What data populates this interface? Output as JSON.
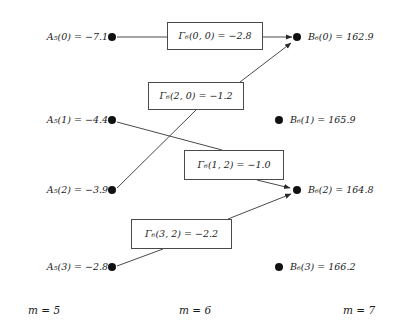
{
  "figure": {
    "type": "trellis-diagram"
  },
  "left_nodes": [
    {
      "id": "A5-0",
      "label_prefix": "A",
      "label_sub": "5",
      "label_text": "A₅(0) = −7.1",
      "index": 0,
      "value": -7.1,
      "x": 112,
      "y": 37
    },
    {
      "id": "A5-1",
      "label_prefix": "A",
      "label_sub": "5",
      "label_text": "A₅(1) = −4.4",
      "index": 1,
      "value": -4.4,
      "x": 112,
      "y": 120
    },
    {
      "id": "A5-2",
      "label_prefix": "A",
      "label_sub": "5",
      "label_text": "A₅(2) = −3.9",
      "index": 2,
      "value": -3.9,
      "x": 112,
      "y": 190
    },
    {
      "id": "A5-3",
      "label_prefix": "A",
      "label_sub": "5",
      "label_text": "A₅(3) = −2.8",
      "index": 3,
      "value": -2.8,
      "x": 112,
      "y": 267
    }
  ],
  "right_nodes": [
    {
      "id": "B6-0",
      "label_prefix": "B",
      "label_sub": "6",
      "label_text": "B₆(0) = 162.9",
      "index": 0,
      "value": 162.9,
      "x": 297,
      "y": 37
    },
    {
      "id": "B6-1",
      "label_prefix": "B",
      "label_sub": "6",
      "label_text": "B₆(1) = 165.9",
      "index": 1,
      "value": 165.9,
      "x": 279,
      "y": 120
    },
    {
      "id": "B6-2",
      "label_prefix": "B",
      "label_sub": "6",
      "label_text": "B₆(2) = 164.8",
      "index": 2,
      "value": 164.8,
      "x": 297,
      "y": 190
    },
    {
      "id": "B6-3",
      "label_prefix": "B",
      "label_sub": "6",
      "label_text": "B₆(3) = 166.2",
      "index": 3,
      "value": 166.2,
      "x": 279,
      "y": 267
    }
  ],
  "gamma_boxes": [
    {
      "id": "G-0-0",
      "label_text": "Γ₆(0, 0) = −2.8",
      "from": 0,
      "to": 0,
      "value": -2.8,
      "x": 167,
      "y": 22,
      "w": 96,
      "h": 28
    },
    {
      "id": "G-2-0",
      "label_text": "Γ₆(2, 0) = −1.2",
      "from": 2,
      "to": 0,
      "value": -1.2,
      "x": 148,
      "y": 82,
      "w": 96,
      "h": 28
    },
    {
      "id": "G-1-2",
      "label_text": "Γ₆(1, 2) = −1.0",
      "from": 1,
      "to": 2,
      "value": -1.0,
      "x": 184,
      "y": 150,
      "w": 100,
      "h": 30
    },
    {
      "id": "G-3-2",
      "label_text": "Γ₆(3, 2) = −2.2",
      "from": 3,
      "to": 2,
      "value": -2.2,
      "x": 131,
      "y": 219,
      "w": 101,
      "h": 30
    }
  ],
  "edges": [
    {
      "id": "edge-0-0",
      "from": "A5-0",
      "to": "B6-0",
      "via": "G-0-0",
      "arrow": true
    },
    {
      "id": "edge-2-0",
      "from": "A5-2",
      "to": "B6-0",
      "via": "G-2-0",
      "arrow": true
    },
    {
      "id": "edge-1-2",
      "from": "A5-1",
      "to": "B6-2",
      "via": "G-1-2",
      "arrow": true
    },
    {
      "id": "edge-3-2",
      "from": "A5-3",
      "to": "B6-2",
      "via": "G-3-2",
      "arrow": true
    }
  ],
  "stage_labels": [
    {
      "id": "stage-m5",
      "text": "m = 5",
      "x": 28,
      "y": 310
    },
    {
      "id": "stage-m6",
      "text": "m = 6",
      "x": 179,
      "y": 310
    },
    {
      "id": "stage-m7",
      "text": "m = 7",
      "x": 343,
      "y": 310
    }
  ],
  "colors": {
    "node": "#111111",
    "edge": "#4a4a4a",
    "box_border": "#4a4a4a",
    "text": "#1a1a1a",
    "background": "#ffffff"
  }
}
